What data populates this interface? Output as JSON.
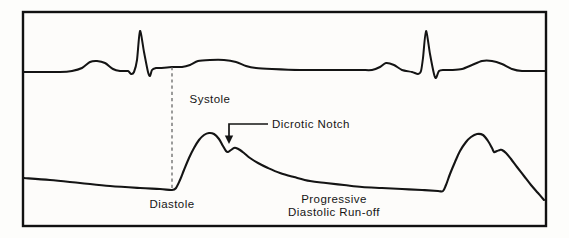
{
  "figure": {
    "background_color": "#fdfcfa",
    "ink_color": "#141414",
    "frame_color": "#111111",
    "timing_line_color": "#5b5b5b"
  },
  "labels": {
    "systole": "Systole",
    "dicrotic_notch": "Dicrotic Notch",
    "diastole": "Diastole",
    "runoff_line1": "Progressive",
    "runoff_line2": "Diastolic Run-off"
  },
  "chart_data": {
    "type": "line",
    "xlabel": "",
    "ylabel": "",
    "grid": false,
    "legend_position": "none",
    "axis_ranges": {
      "x": [
        22,
        548
      ],
      "y_ecg": [
        26,
        78
      ],
      "y_pressure": [
        120,
        210
      ]
    },
    "annotations": [
      {
        "text": "Systole",
        "x": 210,
        "y": 103,
        "anchor": "middle",
        "describes": "peak of arterial systolic upstroke, first beat"
      },
      {
        "text": "Dicrotic Notch",
        "x": 272,
        "y": 128,
        "anchor": "start",
        "describes": "incisura on downslope of first pressure pulse",
        "leader": {
          "type": "elbow-arrow",
          "from_x": 268,
          "from_y": 124,
          "corner_x": 229,
          "corner_y": 124,
          "to_x": 229,
          "to_y": 144
        }
      },
      {
        "text": "Diastole",
        "x": 172,
        "y": 208,
        "anchor": "middle",
        "describes": "end-diastolic trough just before upstroke"
      },
      {
        "text": "Progressive",
        "x": 334,
        "y": 203,
        "anchor": "middle",
        "describes": "diastolic decay limb of pressure trace"
      },
      {
        "text": "Diastolic Run-off",
        "x": 334,
        "y": 216,
        "anchor": "middle",
        "describes": "diastolic decay limb of pressure trace"
      }
    ],
    "timing_line": {
      "x": 172,
      "y_top": 67,
      "y_bottom": 190,
      "style": "dashed",
      "describes": "vertical dashed line linking ECG S-wave to diastolic trough"
    },
    "series": [
      {
        "name": "ECG",
        "role": "electrocardiogram",
        "baseline_y": 70,
        "beats": [
          {
            "beat": 1,
            "p_wave": {
              "onset_x": 78,
              "peak_x": 96,
              "peak_y": 61,
              "offset_x": 114
            },
            "qrs": {
              "q_x": 131,
              "q_y": 74,
              "r_x": 140,
              "r_y": 31,
              "s_x": 150,
              "s_y": 76
            },
            "t_wave": {
              "onset_x": 185,
              "peak_x": 213,
              "peak_y": 60,
              "offset_x": 243
            }
          },
          {
            "beat": 2,
            "p_wave": {
              "onset_x": 372,
              "peak_x": 386,
              "peak_y": 63,
              "offset_x": 400
            },
            "qrs": {
              "q_x": 418,
              "q_y": 74,
              "r_x": 426,
              "r_y": 31,
              "s_x": 436,
              "s_y": 78
            },
            "t_wave": {
              "onset_x": 462,
              "peak_x": 489,
              "peak_y": 61,
              "offset_x": 516
            }
          }
        ],
        "points": [
          [
            24,
            72
          ],
          [
            60,
            72
          ],
          [
            72,
            71
          ],
          [
            82,
            68
          ],
          [
            90,
            62
          ],
          [
            97,
            61
          ],
          [
            105,
            63
          ],
          [
            113,
            69
          ],
          [
            120,
            71
          ],
          [
            128,
            71
          ],
          [
            131,
            74
          ],
          [
            134,
            72
          ],
          [
            137,
            60
          ],
          [
            140,
            31
          ],
          [
            144,
            52
          ],
          [
            148,
            72
          ],
          [
            150,
            76
          ],
          [
            152,
            70
          ],
          [
            156,
            68
          ],
          [
            160,
            68
          ],
          [
            172,
            67
          ],
          [
            182,
            67
          ],
          [
            190,
            65
          ],
          [
            198,
            61
          ],
          [
            210,
            60
          ],
          [
            224,
            60
          ],
          [
            236,
            62
          ],
          [
            246,
            66
          ],
          [
            256,
            68
          ],
          [
            272,
            69
          ],
          [
            300,
            70
          ],
          [
            330,
            70
          ],
          [
            360,
            70
          ],
          [
            372,
            70
          ],
          [
            380,
            67
          ],
          [
            386,
            63
          ],
          [
            394,
            65
          ],
          [
            402,
            70
          ],
          [
            412,
            72
          ],
          [
            418,
            74
          ],
          [
            421,
            71
          ],
          [
            423,
            58
          ],
          [
            426,
            31
          ],
          [
            430,
            54
          ],
          [
            434,
            74
          ],
          [
            436,
            78
          ],
          [
            439,
            71
          ],
          [
            444,
            70
          ],
          [
            452,
            70
          ],
          [
            462,
            69
          ],
          [
            472,
            65
          ],
          [
            482,
            61
          ],
          [
            492,
            61
          ],
          [
            502,
            64
          ],
          [
            512,
            69
          ],
          [
            522,
            71
          ],
          [
            546,
            71
          ]
        ]
      },
      {
        "name": "Arterial Pressure",
        "role": "arterial-blood-pressure",
        "features": {
          "diastolic_trough_1_x": 172,
          "diastolic_trough_1_y": 190,
          "systolic_peak_1_x": 209,
          "systolic_peak_1_y": 133,
          "dicrotic_notch_x": 228,
          "dicrotic_notch_y": 152,
          "dicrotic_wave_peak_x": 236,
          "dicrotic_wave_peak_y": 148,
          "diastolic_trough_2_x": 443,
          "diastolic_trough_2_y": 191,
          "systolic_peak_2_x": 477,
          "systolic_peak_2_y": 134,
          "dicrotic_notch_2_x": 494,
          "dicrotic_notch_2_y": 152,
          "dicrotic_wave_peak_2_x": 502,
          "dicrotic_wave_peak_2_y": 150
        },
        "points": [
          [
            24,
            178
          ],
          [
            50,
            180
          ],
          [
            80,
            183
          ],
          [
            110,
            186
          ],
          [
            140,
            188
          ],
          [
            160,
            189
          ],
          [
            172,
            190
          ],
          [
            176,
            188
          ],
          [
            180,
            180
          ],
          [
            184,
            170
          ],
          [
            189,
            158
          ],
          [
            194,
            148
          ],
          [
            199,
            140
          ],
          [
            204,
            135
          ],
          [
            209,
            133
          ],
          [
            214,
            134
          ],
          [
            219,
            139
          ],
          [
            223,
            146
          ],
          [
            226,
            151
          ],
          [
            228,
            152
          ],
          [
            231,
            150
          ],
          [
            234,
            148
          ],
          [
            236,
            148
          ],
          [
            240,
            150
          ],
          [
            244,
            153
          ],
          [
            250,
            158
          ],
          [
            258,
            163
          ],
          [
            268,
            168
          ],
          [
            280,
            173
          ],
          [
            294,
            177
          ],
          [
            310,
            181
          ],
          [
            326,
            183
          ],
          [
            344,
            185
          ],
          [
            362,
            187
          ],
          [
            382,
            188
          ],
          [
            402,
            189
          ],
          [
            422,
            190
          ],
          [
            438,
            191
          ],
          [
            443,
            191
          ],
          [
            446,
            185
          ],
          [
            450,
            174
          ],
          [
            455,
            162
          ],
          [
            460,
            151
          ],
          [
            466,
            142
          ],
          [
            471,
            137
          ],
          [
            477,
            134
          ],
          [
            483,
            135
          ],
          [
            488,
            141
          ],
          [
            492,
            148
          ],
          [
            494,
            152
          ],
          [
            497,
            151
          ],
          [
            500,
            150
          ],
          [
            502,
            150
          ],
          [
            506,
            153
          ],
          [
            511,
            159
          ],
          [
            517,
            167
          ],
          [
            524,
            176
          ],
          [
            531,
            185
          ],
          [
            538,
            193
          ],
          [
            544,
            200
          ]
        ]
      }
    ]
  }
}
